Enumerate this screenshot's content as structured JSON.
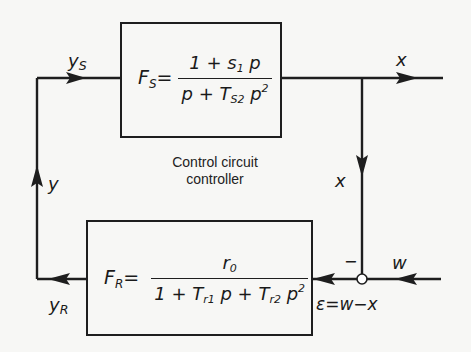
{
  "diagram": {
    "type": "control-loop-block-diagram",
    "caption": {
      "line1": "Control circuit",
      "line2": "controller"
    },
    "plant_block": {
      "lhs": "F",
      "lhs_sub": "S",
      "equals": "=",
      "numerator": {
        "a": "1 + s",
        "a_sub": "1",
        "b": " p"
      },
      "denominator": {
        "a": "p + T",
        "a_sub": "S2",
        "b": " p",
        "b_sup": "2"
      }
    },
    "controller_block": {
      "lhs": "F",
      "lhs_sub": "R",
      "equals": "=",
      "numerator": {
        "a": "r",
        "a_sub": "0"
      },
      "denominator": {
        "a": "1 + T",
        "a_sub": "r1",
        "b": " p + T",
        "b_sub": "r2",
        "c": " p",
        "c_sup": "2"
      }
    },
    "signals": {
      "ys": {
        "base": "y",
        "sub": "S"
      },
      "x_out": {
        "base": "x"
      },
      "x_feedback": {
        "base": "x"
      },
      "y": {
        "base": "y"
      },
      "yr": {
        "base": "y",
        "sub": "R"
      },
      "w": {
        "base": "w"
      },
      "minus": "−",
      "error": "ε=w−x"
    },
    "colors": {
      "line": "#1e1e1e",
      "background": "#f7f7f5"
    }
  }
}
